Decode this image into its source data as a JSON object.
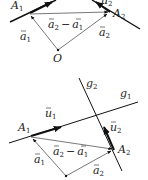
{
  "top_diagram": {
    "points": {
      "A1": "A",
      "A1_sub": "1",
      "A2": "A",
      "A2_sub": "2",
      "O": "O"
    },
    "vectors": {
      "a1": "a",
      "a1_sub": "1",
      "a2": "a",
      "a2_sub": "2",
      "diff_a2": "a",
      "diff_a2_sub": "2",
      "diff_minus": "−",
      "diff_a1": "a",
      "diff_a1_sub": "1",
      "u2_partial": "u",
      "u2_partial_sub": "2"
    }
  },
  "bottom_diagram": {
    "lines": {
      "g1": "g",
      "g1_sub": "1",
      "g2": "g",
      "g2_sub": "2"
    },
    "points": {
      "A1": "A",
      "A1_sub": "1",
      "A2": "A",
      "A2_sub": "2"
    },
    "vectors": {
      "u1": "u",
      "u1_sub": "1",
      "u2": "u",
      "u2_sub": "2",
      "a1": "a",
      "a1_sub": "1",
      "a2": "a",
      "a2_sub": "2",
      "diff_a2": "a",
      "diff_a2_sub": "2",
      "diff_minus": "−",
      "diff_a1": "a",
      "diff_a1_sub": "1"
    }
  },
  "colors": {
    "thick_line": "#111111",
    "thin_line": "#555555",
    "text": "#222222"
  }
}
